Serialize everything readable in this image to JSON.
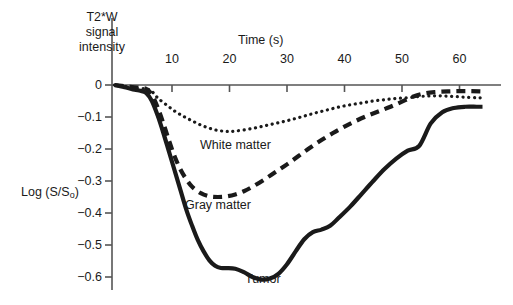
{
  "figure": {
    "background": "#ffffff",
    "ink_color": "#1a1a1a",
    "axis_color": "#555555"
  },
  "chart_data": {
    "type": "line",
    "title": "",
    "ylabel": "Log (S/S",
    "ylabel_sub": "o",
    "ylabel_suffix": ")",
    "xlabel": "Time (s)",
    "secondary_ylabel": "T2*W signal intensity",
    "xlim": [
      0,
      67
    ],
    "ylim": [
      -0.65,
      0.03
    ],
    "grid": false,
    "legend_position": "inline-annotations",
    "xticks": [
      10,
      20,
      30,
      40,
      50,
      60
    ],
    "xtick_labels": [
      "10",
      "20",
      "30",
      "40",
      "50",
      "60"
    ],
    "yticks": [
      0,
      -0.1,
      -0.2,
      -0.3,
      -0.4,
      -0.5,
      -0.6
    ],
    "ytick_labels": [
      "0",
      "−0.1",
      "−0.2",
      "−0.3",
      "−0.4",
      "−0.5",
      "−0.6"
    ],
    "series": [
      {
        "name": "White matter",
        "style": "dotted",
        "color": "#1a1a1a",
        "linewidth": 3.2,
        "x": [
          0,
          2,
          4,
          5.5,
          6.5,
          7.5,
          9,
          10.5,
          12,
          13.5,
          15,
          16.5,
          18,
          19.5,
          21,
          23,
          25,
          27,
          29,
          31,
          33,
          35,
          37,
          39,
          41,
          43,
          45,
          47,
          49,
          51,
          53,
          55,
          57,
          59,
          61,
          63,
          64
        ],
        "y": [
          0.0,
          -0.005,
          -0.01,
          -0.012,
          -0.02,
          -0.04,
          -0.062,
          -0.082,
          -0.098,
          -0.112,
          -0.125,
          -0.135,
          -0.142,
          -0.145,
          -0.144,
          -0.139,
          -0.132,
          -0.124,
          -0.116,
          -0.107,
          -0.097,
          -0.087,
          -0.078,
          -0.069,
          -0.062,
          -0.056,
          -0.05,
          -0.046,
          -0.042,
          -0.04,
          -0.036,
          -0.034,
          -0.034,
          -0.036,
          -0.038,
          -0.04,
          -0.04
        ]
      },
      {
        "name": "Gray matter",
        "style": "dashed",
        "color": "#1a1a1a",
        "linewidth": 4.2,
        "x": [
          0,
          2,
          4,
          5.5,
          6.5,
          7.5,
          8.5,
          9.5,
          10.5,
          11.5,
          12.5,
          13.5,
          15,
          16.5,
          18,
          19.5,
          21,
          22.5,
          24,
          26,
          28,
          30,
          32,
          34,
          36,
          38,
          40,
          42,
          44,
          46,
          48,
          50,
          52,
          54,
          56,
          58,
          60,
          62,
          64
        ],
        "y": [
          0.0,
          -0.004,
          -0.008,
          -0.012,
          -0.03,
          -0.07,
          -0.12,
          -0.175,
          -0.225,
          -0.265,
          -0.295,
          -0.318,
          -0.338,
          -0.348,
          -0.35,
          -0.348,
          -0.342,
          -0.332,
          -0.318,
          -0.296,
          -0.272,
          -0.248,
          -0.222,
          -0.196,
          -0.172,
          -0.15,
          -0.13,
          -0.112,
          -0.096,
          -0.082,
          -0.068,
          -0.052,
          -0.036,
          -0.026,
          -0.022,
          -0.02,
          -0.019,
          -0.019,
          -0.02
        ]
      },
      {
        "name": "Tumor",
        "style": "solid",
        "color": "#1a1a1a",
        "linewidth": 4.2,
        "x": [
          0,
          2,
          3.5,
          4.5,
          5.5,
          6.5,
          7.5,
          8.5,
          9.5,
          10.5,
          11.5,
          12.5,
          13.5,
          14.5,
          15.5,
          16.5,
          17.5,
          18.5,
          19.5,
          21,
          22.5,
          24,
          25.5,
          27,
          28.5,
          30,
          31.5,
          33,
          34.5,
          36,
          37.5,
          39,
          41,
          43,
          45,
          47,
          49,
          51,
          53,
          55,
          57,
          59,
          61,
          63,
          64
        ],
        "y": [
          0.0,
          -0.008,
          -0.015,
          -0.018,
          -0.025,
          -0.05,
          -0.095,
          -0.15,
          -0.21,
          -0.27,
          -0.33,
          -0.39,
          -0.44,
          -0.485,
          -0.52,
          -0.548,
          -0.565,
          -0.572,
          -0.572,
          -0.574,
          -0.585,
          -0.6,
          -0.608,
          -0.605,
          -0.59,
          -0.56,
          -0.52,
          -0.482,
          -0.46,
          -0.452,
          -0.44,
          -0.415,
          -0.38,
          -0.34,
          -0.3,
          -0.262,
          -0.23,
          -0.205,
          -0.19,
          -0.12,
          -0.085,
          -0.072,
          -0.068,
          -0.068,
          -0.068
        ]
      }
    ],
    "annotations": [
      {
        "text": "White matter",
        "series": "White matter"
      },
      {
        "text": "Gray matter",
        "series": "Gray matter"
      },
      {
        "text": "Tumor",
        "series": "Tumor"
      }
    ]
  }
}
